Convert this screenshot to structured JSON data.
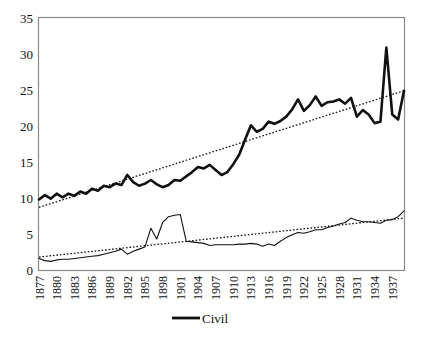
{
  "figure": {
    "title": "",
    "background_color": "#ffffff",
    "frame_color": "#8a8a8a"
  },
  "chart_data": {
    "type": "line",
    "title": "",
    "xlabel": "",
    "ylabel": "",
    "ylim": [
      0,
      35
    ],
    "ytick_values": [
      0,
      5,
      10,
      15,
      20,
      25,
      30,
      35
    ],
    "ytick_labels": [
      "0",
      "5",
      "10",
      "15",
      "20",
      "25",
      "30",
      "35"
    ],
    "xlim": [
      1877,
      1939
    ],
    "xtick_labels": [
      "1877",
      "1880",
      "1883",
      "1886",
      "1889",
      "1892",
      "1895",
      "1898",
      "1901",
      "1904",
      "1907",
      "1910",
      "1913",
      "1916",
      "1919",
      "1922",
      "1925",
      "1928",
      "1931",
      "1934",
      "1937"
    ],
    "xtick_rotation_degrees": 90,
    "grid": false,
    "legend": {
      "position": "bottom-center",
      "entries": [
        {
          "label": "Civil",
          "marker": "thick-line",
          "color": "#111111"
        }
      ]
    },
    "x": [
      1877,
      1878,
      1879,
      1880,
      1881,
      1882,
      1883,
      1884,
      1885,
      1886,
      1887,
      1888,
      1889,
      1890,
      1891,
      1892,
      1893,
      1894,
      1895,
      1896,
      1897,
      1898,
      1899,
      1900,
      1901,
      1902,
      1903,
      1904,
      1905,
      1906,
      1907,
      1908,
      1909,
      1910,
      1911,
      1912,
      1913,
      1914,
      1915,
      1916,
      1917,
      1918,
      1919,
      1920,
      1921,
      1922,
      1923,
      1924,
      1925,
      1926,
      1927,
      1928,
      1929,
      1930,
      1931,
      1932,
      1933,
      1934,
      1935,
      1936,
      1937,
      1938,
      1939
    ],
    "series": [
      {
        "name": "Civil",
        "style": "thick-solid",
        "color": "#111111",
        "values": [
          9.8,
          10.4,
          9.9,
          10.6,
          10.1,
          10.6,
          10.3,
          10.9,
          10.6,
          11.3,
          11.0,
          11.7,
          11.5,
          12.0,
          11.8,
          13.2,
          12.2,
          11.7,
          12.0,
          12.5,
          11.9,
          11.5,
          11.8,
          12.5,
          12.4,
          13.0,
          13.6,
          14.3,
          14.1,
          14.6,
          13.9,
          13.2,
          13.6,
          14.7,
          16.0,
          18.1,
          20.1,
          19.2,
          19.6,
          20.6,
          20.3,
          20.7,
          21.3,
          22.3,
          23.7,
          22.1,
          22.9,
          24.1,
          22.8,
          23.3,
          23.4,
          23.7,
          23.1,
          23.9,
          21.3,
          22.2,
          21.6,
          20.4,
          20.6,
          30.9,
          21.6,
          20.9,
          24.9
        ]
      },
      {
        "name": "Military",
        "style": "thin-solid",
        "color": "#111111",
        "values": [
          1.6,
          1.3,
          1.2,
          1.4,
          1.5,
          1.5,
          1.6,
          1.7,
          1.8,
          1.9,
          2.0,
          2.2,
          2.4,
          2.6,
          2.9,
          2.2,
          2.6,
          2.9,
          3.2,
          5.8,
          4.3,
          6.6,
          7.4,
          7.6,
          7.7,
          4.0,
          3.9,
          3.8,
          3.7,
          3.4,
          3.5,
          3.5,
          3.5,
          3.5,
          3.6,
          3.6,
          3.7,
          3.6,
          3.3,
          3.6,
          3.4,
          4.0,
          4.5,
          4.9,
          5.2,
          5.1,
          5.3,
          5.6,
          5.6,
          5.9,
          6.1,
          6.4,
          6.6,
          7.2,
          6.9,
          6.7,
          6.7,
          6.6,
          6.5,
          6.9,
          7.0,
          7.4,
          8.2
        ]
      }
    ],
    "trendlines": [
      {
        "for_series": "Civil",
        "style": "dotted",
        "color": "#111111",
        "start_value": 8.7,
        "end_value": 24.9
      },
      {
        "for_series": "Military",
        "style": "dotted",
        "color": "#111111",
        "start_value": 1.8,
        "end_value": 7.2
      }
    ]
  }
}
